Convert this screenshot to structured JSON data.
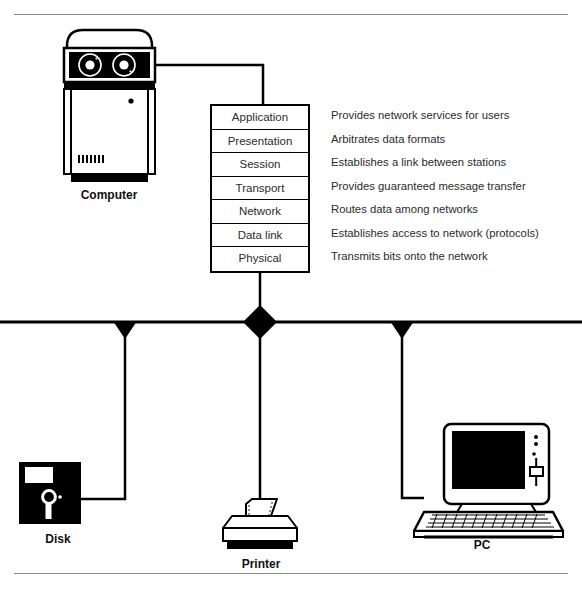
{
  "diagram": {
    "ink_color": "#000000",
    "text_color": "#2b2b2b",
    "rule_color": "#8a8a8a",
    "background": "#ffffff"
  },
  "osi_stack": {
    "layers": [
      {
        "name": "Application",
        "description": "Provides network services for users"
      },
      {
        "name": "Presentation",
        "description": "Arbitrates data formats"
      },
      {
        "name": "Session",
        "description": "Establishes a link between stations"
      },
      {
        "name": "Transport",
        "description": "Provides guaranteed message transfer"
      },
      {
        "name": "Network",
        "description": "Routes data among networks"
      },
      {
        "name": "Data link",
        "description": "Establishes access to network (protocols)"
      },
      {
        "name": "Physical",
        "description": "Transmits bits onto the network"
      }
    ]
  },
  "devices": {
    "computer": {
      "label": "Computer"
    },
    "disk": {
      "label": "Disk"
    },
    "printer": {
      "label": "Printer"
    },
    "pc": {
      "label": "PC"
    }
  },
  "bus": {
    "taps": [
      {
        "device": "disk",
        "shape": "triangle-down"
      },
      {
        "device": "printer",
        "shape": "diamond"
      },
      {
        "device": "pc",
        "shape": "triangle-down"
      }
    ]
  }
}
